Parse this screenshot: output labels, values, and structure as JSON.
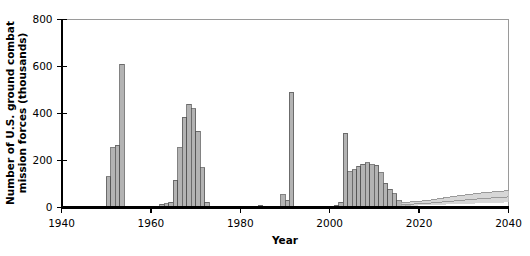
{
  "chart_data": {
    "type": "bar",
    "title": "",
    "xlabel": "Year",
    "ylabel": "Number of U.S. ground combat mission forces (thousands)",
    "xlim": [
      1940,
      2040
    ],
    "ylim": [
      0,
      800
    ],
    "xticks": [
      1940,
      1960,
      1980,
      2000,
      2020,
      2040
    ],
    "yticks": [
      0,
      200,
      400,
      600,
      800
    ],
    "xtick_labels": [
      "1940",
      "1960",
      "1980",
      "2000",
      "2020",
      "2040"
    ],
    "ytick_labels": [
      "0",
      "200",
      "400",
      "600",
      "800"
    ],
    "grid": false,
    "legend": null,
    "bar_color": "#b3b3b3",
    "bar_edge_color": "#4d4d4d",
    "axis_color": "#000000",
    "projection_band_color": "#c9c9c9",
    "projection_line_color": "#9a9a9a",
    "series": [
      {
        "name": "U.S. ground combat mission forces",
        "x": [
          1950,
          1951,
          1952,
          1953,
          1959,
          1961,
          1962,
          1963,
          1964,
          1965,
          1966,
          1967,
          1968,
          1969,
          1970,
          1971,
          1972,
          1978,
          1983,
          1984,
          1989,
          1990,
          1991,
          1999,
          2001,
          2002,
          2003,
          2004,
          2005,
          2006,
          2007,
          2008,
          2009,
          2010,
          2011,
          2012,
          2013,
          2014,
          2015,
          2016,
          2017
        ],
        "values": [
          130,
          255,
          265,
          610,
          3,
          6,
          14,
          15,
          22,
          115,
          255,
          385,
          440,
          420,
          325,
          170,
          22,
          4,
          6,
          10,
          55,
          30,
          490,
          5,
          10,
          22,
          315,
          152,
          160,
          175,
          185,
          190,
          182,
          180,
          148,
          103,
          77,
          58,
          28,
          12,
          8
        ]
      }
    ],
    "projection": {
      "note": "shaded uncertainty band with central line from ~2016 to 2040",
      "x_start": 2016,
      "x_end": 2040,
      "upper": [
        20,
        30,
        48,
        62,
        72
      ],
      "lower": [
        6,
        10,
        14,
        18,
        22
      ],
      "center": [
        12,
        18,
        28,
        38,
        45
      ]
    }
  }
}
